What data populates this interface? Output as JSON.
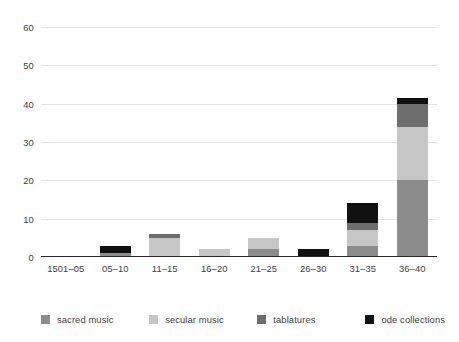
{
  "chart_data": {
    "type": "bar",
    "subtype": "stacked-bar",
    "title": "",
    "xlabel": "",
    "ylabel": "",
    "categories": [
      "1501–05",
      "05–10",
      "11–15",
      "16–20",
      "21–25",
      "26–30",
      "31–35",
      "36–40"
    ],
    "series": [
      {
        "name": "sacred music",
        "color": "#8c8c8c",
        "values": [
          0,
          1,
          0,
          0,
          2,
          0,
          3,
          20
        ]
      },
      {
        "name": "secular music",
        "color": "#c6c6c6",
        "values": [
          0,
          0,
          5,
          2,
          3,
          0,
          4,
          14
        ]
      },
      {
        "name": "tablatures",
        "color": "#6e6e6e",
        "values": [
          0,
          0,
          1,
          0,
          0,
          0,
          2,
          6
        ]
      },
      {
        "name": "ode collections",
        "color": "#111111",
        "values": [
          0,
          2,
          0,
          0,
          0,
          2,
          5,
          1.5
        ]
      }
    ],
    "totals": [
      0,
      3,
      6,
      2,
      5,
      2,
      14,
      41.5
    ],
    "ylim": [
      0,
      60
    ],
    "yticks": [
      0,
      10,
      20,
      30,
      40,
      50,
      60
    ],
    "ytick_labels": [
      "0",
      "10",
      "20",
      "30",
      "40",
      "50",
      "60"
    ],
    "grid": true,
    "grid_axis": "y",
    "legend_position": "bottom",
    "background_color": "#ffffff",
    "gridline_color": "#e3e3e3",
    "axis_color": "#2a2a2a",
    "text_color": "#3d3d3d"
  },
  "legend": {
    "items": [
      {
        "label": "sacred music",
        "color": "#8c8c8c"
      },
      {
        "label": "secular music",
        "color": "#c6c6c6"
      },
      {
        "label": "tablatures",
        "color": "#6e6e6e"
      },
      {
        "label": "ode collections",
        "color": "#111111"
      }
    ]
  }
}
